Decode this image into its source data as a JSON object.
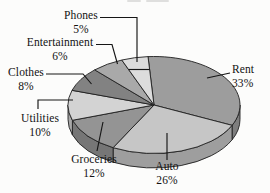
{
  "chart_data": {
    "type": "pie",
    "style": "3d",
    "title": "",
    "unit": "%",
    "direction": "clockwise",
    "start": "top",
    "legend": "none",
    "categories": [
      "Rent",
      "Auto",
      "Groceries",
      "Utilities",
      "Clothes",
      "Entertainment",
      "Phones"
    ],
    "values": [
      33,
      26,
      12,
      10,
      8,
      6,
      5
    ],
    "colors": [
      "#9d9d9d",
      "#c6c6c6",
      "#949494",
      "#d3d3d3",
      "#828282",
      "#a9a9a9",
      "#dcdcdc"
    ],
    "outline_color": "#1f1f1f",
    "leader_line_color": "#161616",
    "display_labels": [
      {
        "text": "Rent",
        "value_text": "33%"
      },
      {
        "text": "Auto",
        "value_text": "26%"
      },
      {
        "text": "Groceries",
        "value_text": "12%"
      },
      {
        "text": "Utilities",
        "value_text": "10%"
      },
      {
        "text": "Clothes",
        "value_text": "8%"
      },
      {
        "text": "Entertainment",
        "value_text": "6%"
      },
      {
        "text": "Phones",
        "value_text": "5%"
      }
    ]
  }
}
